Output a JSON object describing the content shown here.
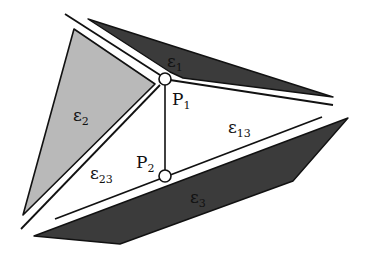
{
  "diagram": {
    "colors": {
      "background": "#ffffff",
      "plane_light": "#b9b9b9",
      "plane_dark": "#3b3b3b",
      "stroke": "#111111"
    },
    "planes": [
      {
        "id": "e1",
        "base": "ε",
        "sub": "1",
        "shade": "dark"
      },
      {
        "id": "e2",
        "base": "ε",
        "sub": "2",
        "shade": "light"
      },
      {
        "id": "e3",
        "base": "ε",
        "sub": "3",
        "shade": "dark"
      }
    ],
    "intersection_lines": [
      {
        "id": "e13",
        "base": "ε",
        "sub": "13"
      },
      {
        "id": "e23",
        "base": "ε",
        "sub": "23"
      }
    ],
    "points": [
      {
        "id": "P1",
        "base": "P",
        "sub": "1"
      },
      {
        "id": "P2",
        "base": "P",
        "sub": "2"
      }
    ]
  }
}
